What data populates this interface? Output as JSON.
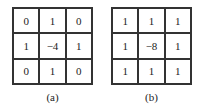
{
  "kernels": [
    {
      "caption": "(a)",
      "cells": [
        "0",
        "1",
        "0",
        "1",
        "−4",
        "1",
        "0",
        "1",
        "0"
      ]
    },
    {
      "caption": "(b)",
      "cells": [
        "1",
        "1",
        "1",
        "1",
        "−8",
        "1",
        "1",
        "1",
        "1"
      ]
    }
  ]
}
